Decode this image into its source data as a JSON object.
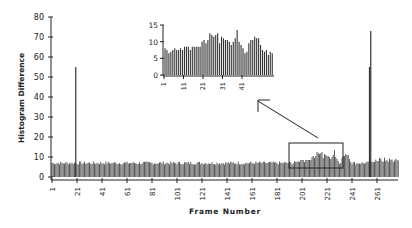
{
  "chart_data": [
    {
      "id": "main",
      "type": "bar",
      "title": "",
      "xlabel": "Frame Number",
      "ylabel": "Histogram Difference",
      "ylim": [
        0,
        80
      ],
      "yticks": [
        0,
        10,
        20,
        30,
        40,
        50,
        60,
        70,
        80
      ],
      "xticks": [
        1,
        21,
        41,
        61,
        81,
        101,
        121,
        141,
        161,
        181,
        201,
        221,
        241,
        261
      ],
      "xrange": [
        1,
        278
      ],
      "grid": false,
      "legend": null,
      "baseline_level": 7,
      "spikes": [
        {
          "frame": 20,
          "value": 55
        },
        {
          "frame": 255,
          "value": 55
        },
        {
          "frame": 256,
          "value": 73
        }
      ],
      "highlight_region": {
        "frames": [
          195,
          240
        ],
        "max_value": 14
      },
      "annotation": "Rectangle around frames ~195-240 with arrow pointing to inset"
    },
    {
      "id": "inset",
      "type": "bar",
      "title": "",
      "xlabel": "",
      "ylabel": "",
      "ylim": [
        0,
        15
      ],
      "yticks": [
        0,
        5,
        10,
        15
      ],
      "xticks": [
        1,
        11,
        21,
        31,
        41
      ],
      "values": [
        8,
        7.5,
        6.5,
        7,
        7.5,
        8,
        7.5,
        7.5,
        8,
        7.5,
        8.5,
        8.5,
        8.5,
        7.5,
        8.5,
        8.5,
        8.5,
        8.5,
        8.5,
        10,
        10.5,
        9.5,
        10.5,
        12.5,
        12,
        11.5,
        12,
        12.5,
        9.5,
        11.5,
        11,
        10.5,
        10.5,
        10,
        9,
        10,
        11,
        13.5,
        10,
        9,
        8,
        6.5,
        7,
        9.5,
        10.5,
        10.5,
        11.5,
        11,
        11,
        9,
        7.5,
        7,
        7.5,
        6,
        7,
        6.5
      ]
    }
  ]
}
